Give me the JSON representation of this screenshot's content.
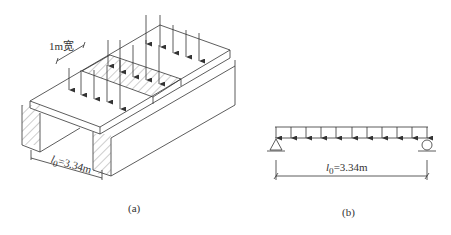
{
  "figure_a": {
    "caption": "(a)",
    "width_label": "1m宽",
    "span_label": "l0=3.34m",
    "span_symbol": "l",
    "span_subscript": "0",
    "span_value": "=3.34m"
  },
  "figure_b": {
    "caption": "(b)",
    "span_symbol": "l",
    "span_subscript": "0",
    "span_value": "=3.34m"
  }
}
